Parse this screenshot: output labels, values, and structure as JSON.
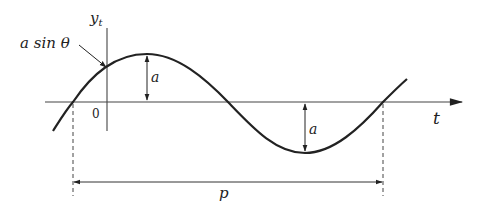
{
  "diagram": {
    "type": "sine-wave-annotated",
    "colors": {
      "stroke": "#222222",
      "background": "#ffffff"
    },
    "labels": {
      "y_axis": "y",
      "y_axis_subscript": "t",
      "x_axis": "t",
      "origin": "0",
      "phase_callout": "a sin θ",
      "amplitude_top": "a",
      "amplitude_bottom": "a",
      "period": "p"
    }
  }
}
